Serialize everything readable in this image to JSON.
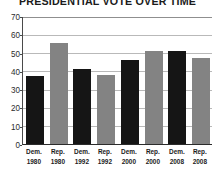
{
  "chart_data": {
    "type": "bar",
    "title": "PRESIDENTIAL VOTE OVER TIME",
    "xlabel": "",
    "ylabel": "",
    "ylim": [
      0,
      70
    ],
    "yticks": [
      0,
      10,
      20,
      30,
      40,
      50,
      60,
      70
    ],
    "ytick_labels": [
      "0",
      "10",
      "20",
      "30",
      "40",
      "50",
      "60",
      "70"
    ],
    "grid": true,
    "legend": "none",
    "categories": [
      "Dem. 1980",
      "Rep. 1980",
      "Dem. 1992",
      "Rep. 1992",
      "Dem. 2000",
      "Rep. 2000",
      "Dem. 2008",
      "Rep. 2008"
    ],
    "values": [
      37,
      55,
      41,
      38,
      46,
      51,
      51,
      47
    ],
    "bars": [
      {
        "party": "Dem.",
        "year": "1980",
        "value": 37,
        "color": "#151515"
      },
      {
        "party": "Rep.",
        "year": "1980",
        "value": 55,
        "color": "#838383"
      },
      {
        "party": "Dem.",
        "year": "1992",
        "value": 41,
        "color": "#151515"
      },
      {
        "party": "Rep.",
        "year": "1992",
        "value": 38,
        "color": "#838383"
      },
      {
        "party": "Dem.",
        "year": "2000",
        "value": 46,
        "color": "#151515"
      },
      {
        "party": "Rep.",
        "year": "2000",
        "value": 51,
        "color": "#838383"
      },
      {
        "party": "Dem.",
        "year": "2008",
        "value": 51,
        "color": "#151515"
      },
      {
        "party": "Rep.",
        "year": "2008",
        "value": 47,
        "color": "#838383"
      }
    ],
    "colors": {
      "democrat": "#151515",
      "republican": "#838383",
      "gridline": "#b9b9b9",
      "axis": "#2b2b2b",
      "text": "#1b1b1b",
      "background": "#ffffff"
    }
  }
}
